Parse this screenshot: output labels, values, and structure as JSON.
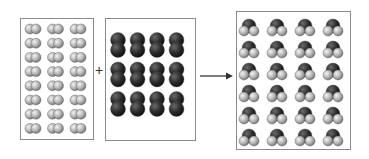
{
  "diagram": {
    "title": "",
    "reactants": [
      {
        "name": "hydrogen",
        "formula": "H2",
        "count": 24,
        "rows": 8,
        "cols": 3,
        "color": "#b8b8b8",
        "orientation": "horizontal"
      },
      {
        "name": "oxygen",
        "formula": "O2",
        "count": 12,
        "rows": 3,
        "cols": 4,
        "color": "#2e2e2e",
        "orientation": "vertical"
      }
    ],
    "products": [
      {
        "name": "water",
        "formula": "H2O",
        "count": 24,
        "rows": 6,
        "cols": 4,
        "o_color": "#2e2e2e",
        "h_color": "#c4c4c4"
      }
    ],
    "operator": "+",
    "arrow": "→",
    "colors": {
      "border": "#8a8a8a",
      "arrow": "#333333"
    }
  }
}
